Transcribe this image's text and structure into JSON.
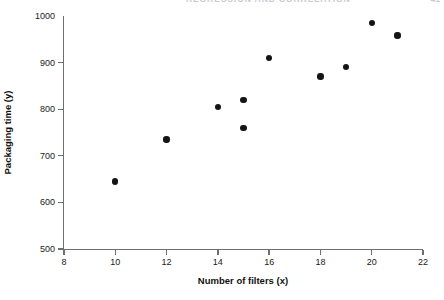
{
  "header": {
    "running_title": "REGRESSION AND CORRELATION",
    "page_number": "41"
  },
  "chart_data": {
    "type": "scatter",
    "title": "",
    "xlabel": "Number of filters (x)",
    "ylabel": "Packaging time (y)",
    "xlim": [
      8,
      22
    ],
    "ylim": [
      500,
      1000
    ],
    "xticks": [
      8,
      10,
      12,
      14,
      16,
      18,
      20,
      22
    ],
    "xticklabels": [
      "8",
      "10",
      "12",
      "14",
      "16",
      "18",
      "20",
      "22"
    ],
    "yticks": [
      500,
      600,
      700,
      800,
      900,
      1000
    ],
    "yticklabels": [
      "500",
      "600",
      "700",
      "800",
      "900",
      "1000"
    ],
    "grid": false,
    "legend": null,
    "marker": "filled-circle",
    "marker_color": "#141414",
    "x": [
      10,
      12,
      14,
      15,
      15,
      16,
      18,
      19,
      20,
      21
    ],
    "y": [
      645,
      735,
      805,
      820,
      760,
      910,
      870,
      890,
      985,
      958
    ],
    "points": [
      {
        "x": 10,
        "y": 645
      },
      {
        "x": 12,
        "y": 735
      },
      {
        "x": 14,
        "y": 805
      },
      {
        "x": 15,
        "y": 820
      },
      {
        "x": 15,
        "y": 760
      },
      {
        "x": 16,
        "y": 910
      },
      {
        "x": 18,
        "y": 870
      },
      {
        "x": 19,
        "y": 890
      },
      {
        "x": 20,
        "y": 985
      },
      {
        "x": 21,
        "y": 958
      }
    ]
  },
  "colors": {
    "axis": "#6e6e6e",
    "text": "#111111",
    "marker": "#141414",
    "header": "#c9c9d2",
    "background": "#ffffff"
  }
}
